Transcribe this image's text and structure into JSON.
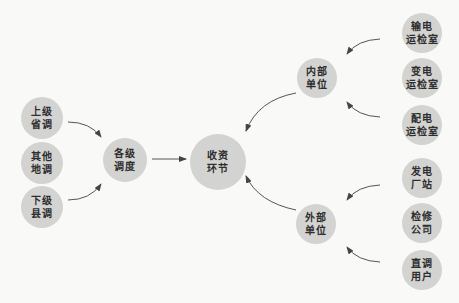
{
  "diagram": {
    "type": "flow",
    "colors": {
      "background": "#f9f9f8",
      "node_fill": "#d3d3d2",
      "text": "#2e2e2e",
      "edge": "#444444"
    },
    "nodes": {
      "shangji_shengdiao": {
        "label": "上级\n省调",
        "cx": 42,
        "cy": 118,
        "r": 21
      },
      "qita_didiao": {
        "label": "其他\n地调",
        "cx": 42,
        "cy": 163,
        "r": 21
      },
      "xiaji_xiandiao": {
        "label": "下级\n县调",
        "cx": 42,
        "cy": 207,
        "r": 21
      },
      "geji_diaodu": {
        "label": "各级\n调度",
        "cx": 125,
        "cy": 160,
        "r": 22
      },
      "shouzi_huanjie": {
        "label": "收资\n环节",
        "cx": 218,
        "cy": 162,
        "r": 28
      },
      "neibu_danwei": {
        "label": "内部\n单位",
        "cx": 317,
        "cy": 78,
        "r": 20
      },
      "waibu_danwei": {
        "label": "外部\n单位",
        "cx": 316,
        "cy": 224,
        "r": 20
      },
      "shudian_yunjianshi": {
        "label": "输电\n运检室",
        "cx": 422,
        "cy": 33,
        "r": 20
      },
      "biandian_yunjianshi": {
        "label": "变电\n运检室",
        "cx": 422,
        "cy": 78,
        "r": 20
      },
      "peidian_yunjianshi": {
        "label": "配电\n运检室",
        "cx": 422,
        "cy": 125,
        "r": 20
      },
      "fadian_changzhan": {
        "label": "发电\n厂站",
        "cx": 422,
        "cy": 178,
        "r": 20
      },
      "jianxiu_gongsi": {
        "label": "检修\n公司",
        "cx": 422,
        "cy": 223,
        "r": 20
      },
      "zhidiao_yonghu": {
        "label": "直调\n用户",
        "cx": 422,
        "cy": 270,
        "r": 20
      }
    },
    "edges": [
      {
        "from": "上级省调",
        "to": "各级调度"
      },
      {
        "from": "下级县调",
        "to": "各级调度"
      },
      {
        "from": "各级调度",
        "to": "收资环节"
      },
      {
        "from": "输电运检室",
        "to": "内部单位"
      },
      {
        "from": "配电运检室",
        "to": "内部单位"
      },
      {
        "from": "内部单位",
        "to": "收资环节"
      },
      {
        "from": "发电厂站",
        "to": "外部单位"
      },
      {
        "from": "直调用户",
        "to": "外部单位"
      },
      {
        "from": "外部单位",
        "to": "收资环节"
      }
    ]
  }
}
